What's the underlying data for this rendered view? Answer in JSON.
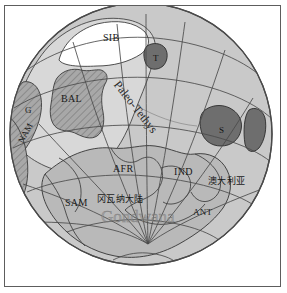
{
  "figure": {
    "type": "paleogeographic-globe-map",
    "projection": "oblique-orthographic-globe",
    "border_color": "#5d5d5d",
    "background_color": "#ffffff"
  },
  "colors": {
    "ocean": "#c9c9c9",
    "landmass_light": "#d8d8d8",
    "craton_mid": "#b9b9b9",
    "hatched_block": "#9a9a9a",
    "dark_block": "#6e6e6e",
    "white_block": "#ffffff",
    "graticule": "#4a4a4a",
    "coastline": "#3c3c3c",
    "label": "#1a1a1a",
    "ghost_label": "#969696"
  },
  "labels": {
    "siberia": "SIB",
    "tarim": "T",
    "baltica": "BAL",
    "greenland": "G",
    "north_america": "NAM",
    "south_china": "S",
    "africa": "AFR",
    "india": "IND",
    "south_america": "SAM",
    "antarctica": "ANT",
    "australia_cjk": "澳大利亚",
    "gondwana_cjk": "冈瓦纳大陆",
    "gondwana_ghost": "Gondwana",
    "paleo_tethys": "Paleo-Tethys"
  },
  "label_positions": {
    "siberia": {
      "x": 98,
      "y": 32,
      "size": 10
    },
    "tarim": {
      "x": 151,
      "y": 53,
      "size": 9
    },
    "baltica": {
      "x": 56,
      "y": 93,
      "size": 10
    },
    "greenland": {
      "x": 18,
      "y": 104,
      "size": 9
    },
    "north_america": {
      "x": 13,
      "y": 138,
      "size": 9,
      "rotation": -62
    },
    "south_china": {
      "x": 219,
      "y": 125,
      "size": 9
    },
    "africa": {
      "x": 110,
      "y": 163,
      "size": 10
    },
    "india": {
      "x": 171,
      "y": 166,
      "size": 10
    },
    "south_america": {
      "x": 62,
      "y": 197,
      "size": 10
    },
    "antarctica": {
      "x": 190,
      "y": 207,
      "size": 9
    },
    "australia_cjk": {
      "x": 207,
      "y": 174,
      "size": 9
    },
    "gondwana_cjk": {
      "x": 95,
      "y": 192,
      "size": 9
    },
    "gondwana_ghost": {
      "x": 98,
      "y": 212,
      "size": 17
    },
    "paleo_tethys": {
      "x": 119,
      "y": 78,
      "size": 12,
      "rotation": 52
    }
  },
  "graticule": {
    "meridian_count": 10,
    "parallel_count": 5,
    "pole_x": 143,
    "pole_y": 238,
    "visible": true
  },
  "blocks": [
    {
      "name": "siberia",
      "label": "SIB",
      "fill": "white_block"
    },
    {
      "name": "tarim",
      "label": "T",
      "fill": "dark_block"
    },
    {
      "name": "baltica",
      "label": "BAL",
      "fill": "hatched_block"
    },
    {
      "name": "greenland",
      "label": "G",
      "fill": "hatched_block"
    },
    {
      "name": "north-america",
      "label": "NAM",
      "fill": "hatched_block"
    },
    {
      "name": "south-china",
      "label": "S",
      "fill": "dark_block"
    },
    {
      "name": "north-china",
      "label": "",
      "fill": "dark_block"
    },
    {
      "name": "gondwana",
      "label": "",
      "fill": "craton_mid"
    }
  ]
}
